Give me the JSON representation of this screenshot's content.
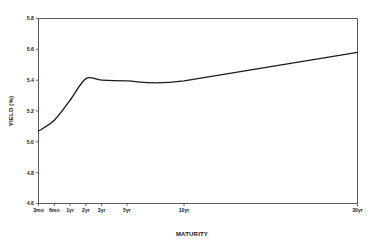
{
  "chart_data": {
    "type": "line",
    "title": "",
    "subtitle": "",
    "xlabel": "MATURITY",
    "ylabel": "YIELD (%)",
    "categories": [
      "3mo",
      "6mo",
      "1yr",
      "2yr",
      "3yr",
      "5yr",
      "10yr",
      "30yr"
    ],
    "x": [
      0.25,
      0.5,
      1,
      2,
      3,
      5,
      10,
      30
    ],
    "values": [
      5.07,
      5.14,
      5.27,
      5.41,
      5.4,
      5.395,
      5.395,
      5.58
    ],
    "series": [
      {
        "name": "Treasury yield curve",
        "values": [
          5.07,
          5.14,
          5.27,
          5.41,
          5.4,
          5.395,
          5.395,
          5.58
        ],
        "color": "#1b1b1b"
      }
    ],
    "ylim": [
      4.6,
      5.8
    ],
    "yticks": [
      4.6,
      4.8,
      5.0,
      5.2,
      5.4,
      5.6,
      5.8
    ],
    "ytick_labels": [
      "4.6",
      "4.8",
      "5.0",
      "5.2",
      "5.4",
      "5.6",
      "5.8"
    ],
    "xtick_labels": [
      "3mo",
      "6mo",
      "1yr",
      "2yr",
      "3yr",
      "5yr",
      "10yr",
      "30yr"
    ],
    "grid": false,
    "legend": false,
    "legend_position": "none",
    "line_color": "#1b1b1b",
    "axis_color": "#4a4a4a",
    "background_color": "#ffffff"
  },
  "axes": {
    "y_title": "YIELD (%)",
    "x_title": "MATURITY"
  }
}
